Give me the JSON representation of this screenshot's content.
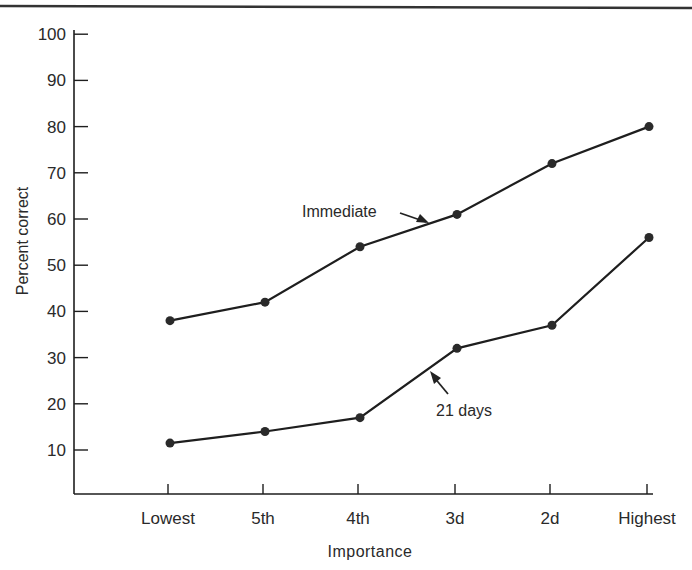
{
  "chart_data": {
    "type": "line",
    "title": "",
    "xlabel": "Importance",
    "ylabel": "Percent correct",
    "categories": [
      "Lowest",
      "5th",
      "4th",
      "3d",
      "2d",
      "Highest"
    ],
    "series": [
      {
        "name": "Immediate",
        "values": [
          38,
          42,
          54,
          61,
          72,
          80
        ]
      },
      {
        "name": "21 days",
        "values": [
          11.5,
          14,
          17,
          32,
          37,
          56
        ]
      }
    ],
    "yticks": [
      10,
      20,
      30,
      40,
      50,
      60,
      70,
      80,
      90,
      100
    ],
    "ylim": [
      0,
      100
    ],
    "grid": false,
    "legend": "inline annotations with arrows",
    "annotations": [
      {
        "text": "Immediate",
        "series": "Immediate"
      },
      {
        "text": "21 days",
        "series": "21 days"
      }
    ]
  },
  "layout": {
    "x_positions": [
      168,
      263,
      358,
      455,
      550,
      647
    ],
    "y_px_at_10": 450,
    "px_per_unit": 4.62,
    "axis_left": 74,
    "axis_bottom": 494,
    "axis_right": 653,
    "axis_top": 34,
    "line_color": "#1e1e1e"
  }
}
